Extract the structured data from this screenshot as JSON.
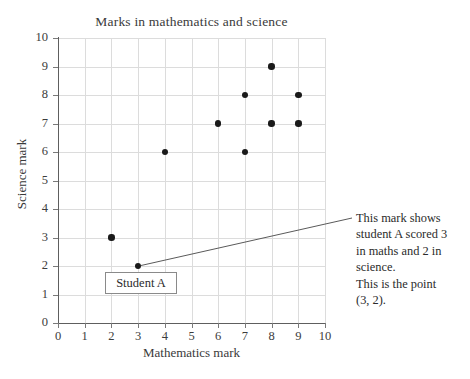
{
  "chart_data": {
    "type": "scatter",
    "title": "Marks in mathematics and science",
    "xlabel": "Mathematics mark",
    "ylabel": "Science mark",
    "xlim": [
      0,
      10
    ],
    "ylim": [
      0,
      10
    ],
    "xticks": [
      "0",
      "1",
      "2",
      "3",
      "4",
      "5",
      "6",
      "7",
      "8",
      "9",
      "10"
    ],
    "yticks": [
      "0",
      "1",
      "2",
      "3",
      "4",
      "5",
      "6",
      "7",
      "8",
      "9",
      "10"
    ],
    "grid": true,
    "legend": "none",
    "point_color": "#1a1a1a",
    "grid_color": "#dcdcdc",
    "axis_color": "#5e5e5e",
    "points": [
      {
        "x": 2,
        "y": 3
      },
      {
        "x": 3,
        "y": 2
      },
      {
        "x": 4,
        "y": 6
      },
      {
        "x": 6,
        "y": 7
      },
      {
        "x": 7,
        "y": 8
      },
      {
        "x": 7,
        "y": 6
      },
      {
        "x": 8,
        "y": 9
      },
      {
        "x": 8,
        "y": 7
      },
      {
        "x": 9,
        "y": 8
      },
      {
        "x": 9,
        "y": 7
      }
    ],
    "annotations": [
      {
        "name": "student-a-label",
        "text": "Student A",
        "target_point": {
          "x": 3,
          "y": 2
        }
      },
      {
        "name": "explanation-callout",
        "lines": [
          "This mark shows",
          "student A scored 3",
          "in maths and 2 in",
          "science.",
          "This is the point",
          "(3, 2)."
        ],
        "target_point": {
          "x": 3,
          "y": 2
        }
      }
    ]
  },
  "callout": {
    "student_label": "Student A",
    "line1": "This mark shows",
    "line2": "student A scored 3",
    "line3": "in maths and 2 in",
    "line4": "science.",
    "line5": "This is the point",
    "line6": "(3, 2)."
  }
}
